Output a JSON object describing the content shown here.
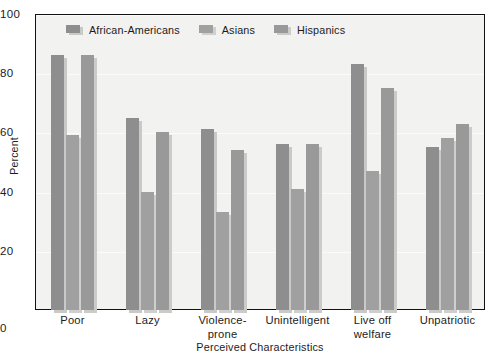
{
  "chart_data": {
    "type": "bar",
    "title": "",
    "xlabel": "Perceived Characteristics",
    "ylabel": "Percent",
    "ylim": [
      0,
      100
    ],
    "yticks": [
      0,
      20,
      40,
      60,
      80,
      100
    ],
    "grid": true,
    "legend_position": "top-left-inside",
    "categories": [
      "Poor",
      "Lazy",
      "Violence-\nprone",
      "Unintelligent",
      "Live off\nwelfare",
      "Unpatriotic"
    ],
    "series": [
      {
        "name": "African-Americans",
        "color": "#8e8e8e",
        "shadow_color": "#c9c9c7",
        "values": [
          86,
          65,
          61,
          56,
          83,
          55
        ]
      },
      {
        "name": "Asians",
        "color": "#a0a0a0",
        "shadow_color": "#cfcfcd",
        "values": [
          59,
          40,
          33,
          41,
          47,
          58
        ]
      },
      {
        "name": "Hispanics",
        "color": "#999999",
        "shadow_color": "#cbcbc9",
        "values": [
          86,
          60,
          54,
          56,
          75,
          63
        ]
      }
    ]
  },
  "axis": {
    "y_title": "Percent",
    "x_title": "Perceived Characteristics",
    "y_tick_labels": [
      "100",
      "80",
      "60",
      "40",
      "20",
      "0"
    ],
    "zero_label": "0"
  },
  "colors": {
    "plot_background": "#f2f2f0",
    "frame": "#111111",
    "gridline": "#fbfbfa",
    "text": "#1c1c1c"
  }
}
